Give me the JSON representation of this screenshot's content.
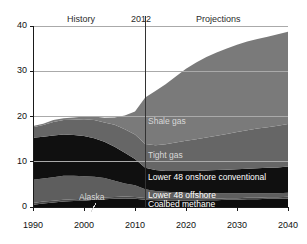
{
  "chart_data": {
    "type": "area",
    "title": "",
    "subtitle": "",
    "xlabel": "",
    "ylabel": "",
    "stacked": true,
    "grid": "horizontal",
    "legend_position": "inline-annotations",
    "xlim": [
      1990,
      2040
    ],
    "ylim": [
      0,
      40
    ],
    "yticks": [
      0,
      10,
      20,
      30,
      40
    ],
    "xticks": [
      1990,
      2000,
      2010,
      2020,
      2030,
      2040
    ],
    "x": [
      1990,
      1992,
      1994,
      1996,
      1998,
      2000,
      2002,
      2004,
      2006,
      2008,
      2010,
      2012,
      2014,
      2016,
      2018,
      2020,
      2022,
      2024,
      2026,
      2028,
      2030,
      2032,
      2034,
      2036,
      2038,
      2040
    ],
    "series": [
      {
        "name": "Coalbed methane",
        "color": "#0d0d0d",
        "values": [
          0.5,
          0.8,
          1.0,
          1.2,
          1.3,
          1.4,
          1.6,
          1.7,
          1.8,
          1.9,
          1.8,
          1.6,
          1.5,
          1.4,
          1.4,
          1.4,
          1.4,
          1.5,
          1.5,
          1.6,
          1.6,
          1.7,
          1.7,
          1.8,
          1.8,
          1.9
        ]
      },
      {
        "name": "Alaska",
        "color": "#4a4a4a",
        "values": [
          0.4,
          0.4,
          0.4,
          0.4,
          0.4,
          0.4,
          0.4,
          0.4,
          0.4,
          0.4,
          0.4,
          0.4,
          0.35,
          0.35,
          0.35,
          0.35,
          0.35,
          0.35,
          0.35,
          0.35,
          0.35,
          0.35,
          0.35,
          0.35,
          0.35,
          0.35
        ]
      },
      {
        "name": "Lower 48 offshore",
        "color": "#5e5e5e",
        "values": [
          5.1,
          5.1,
          5.2,
          5.3,
          5.2,
          5.0,
          4.7,
          4.3,
          3.6,
          2.9,
          2.6,
          1.9,
          1.7,
          1.6,
          1.5,
          1.4,
          1.3,
          1.2,
          1.2,
          1.1,
          1.1,
          1.0,
          1.0,
          0.9,
          0.9,
          0.9
        ]
      },
      {
        "name": "Lower 48 onshore conventional",
        "color": "#101010",
        "values": [
          9.3,
          9.2,
          9.2,
          9.1,
          9.0,
          8.9,
          8.5,
          8.0,
          7.5,
          6.8,
          5.8,
          4.8,
          4.6,
          4.6,
          4.7,
          4.8,
          4.9,
          5.0,
          5.1,
          5.2,
          5.3,
          5.4,
          5.5,
          5.6,
          5.7,
          5.8
        ]
      },
      {
        "name": "Tight gas",
        "color": "#666666",
        "values": [
          2.3,
          2.6,
          3.0,
          3.2,
          3.4,
          3.7,
          4.0,
          4.3,
          4.9,
          5.2,
          5.4,
          5.2,
          5.5,
          5.9,
          6.3,
          6.7,
          7.0,
          7.3,
          7.6,
          7.9,
          8.2,
          8.5,
          8.8,
          9.0,
          9.2,
          9.4
        ]
      },
      {
        "name": "Shale gas",
        "color": "#7a7a7a",
        "values": [
          0.3,
          0.3,
          0.4,
          0.4,
          0.5,
          0.6,
          0.8,
          1.0,
          1.6,
          3.0,
          5.1,
          10.3,
          12.0,
          13.3,
          14.6,
          15.9,
          17.0,
          17.8,
          18.4,
          18.9,
          19.3,
          19.6,
          19.8,
          20.0,
          20.2,
          20.4
        ]
      }
    ],
    "totals": [
      17.9,
      18.4,
      19.2,
      19.6,
      19.8,
      20.0,
      20.0,
      19.7,
      19.8,
      20.2,
      21.1,
      24.2,
      25.65,
      27.15,
      28.85,
      30.55,
      31.95,
      33.15,
      34.15,
      35.05,
      35.85,
      36.55,
      37.15,
      37.65,
      38.15,
      38.75
    ],
    "annotations": {
      "history": "History",
      "divider_year": "2012",
      "projections": "Projections",
      "divider_x": 2012
    },
    "series_labels": {
      "shale": "Shale gas",
      "tight": "Tight gas",
      "onshore": "Lower 48 onshore conventional",
      "offshore": "Lower 48 offshore",
      "coalbed": "Coalbed methane",
      "alaska": "Alaska"
    },
    "colors": {
      "axis": "#1a1a1a",
      "grid": "#aaaaaa",
      "divider": "#333333",
      "background": "#ffffff"
    }
  }
}
